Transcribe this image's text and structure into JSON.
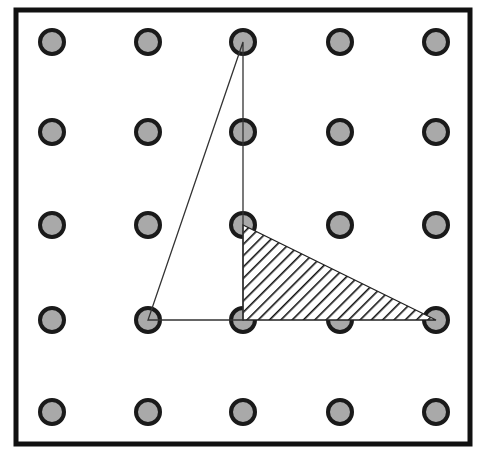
{
  "diagram": {
    "type": "geoboard",
    "grid": {
      "rows": 5,
      "cols": 5
    },
    "frame": {
      "x": 16,
      "y": 10,
      "width": 454,
      "height": 434,
      "stroke": "#111111",
      "stroke_width": 5
    },
    "dot_columns_x": [
      52,
      148,
      243,
      340,
      436
    ],
    "dot_rows_y": [
      42,
      132,
      225,
      320,
      412
    ],
    "dot": {
      "radius": 12,
      "fill": "#a9a9a9",
      "stroke": "#1a1a1a",
      "stroke_width": 4
    },
    "outline_triangle": {
      "vertices_grid": [
        [
          0,
          2
        ],
        [
          3,
          1
        ],
        [
          3,
          2
        ]
      ],
      "stroke": "#333333",
      "stroke_width": 1.3,
      "fill": "none"
    },
    "hatched_triangle": {
      "vertices_grid": [
        [
          2,
          2
        ],
        [
          3,
          2
        ],
        [
          3,
          4
        ]
      ],
      "stroke": "#222222",
      "stroke_width": 1.3,
      "hatch_color": "#111111",
      "hatch_direction": "diagonal /"
    }
  }
}
